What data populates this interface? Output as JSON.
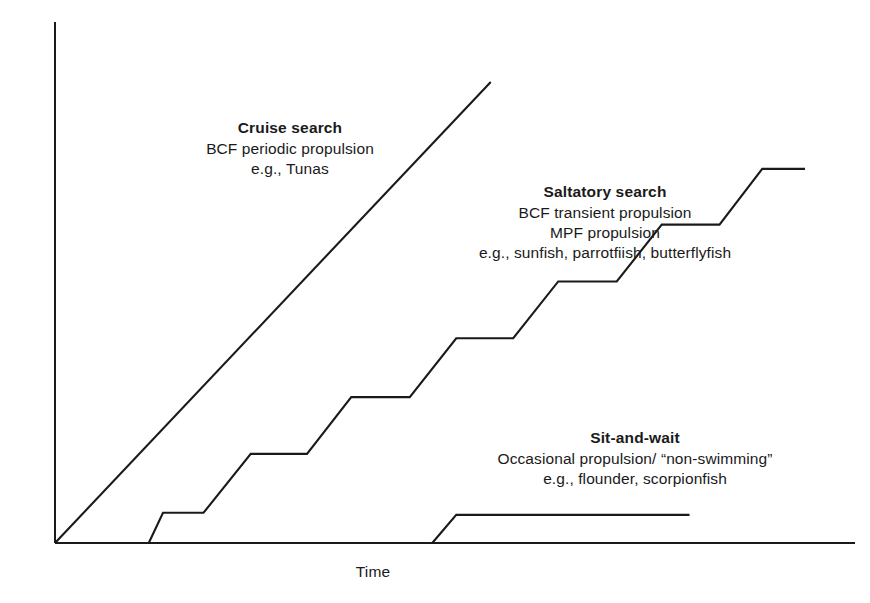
{
  "axes": {
    "x_title": "Time",
    "y_title": "Distance"
  },
  "annotations": {
    "cruise": {
      "title": "Cruise search",
      "line2": "BCF periodic propulsion",
      "line3": "e.g., Tunas"
    },
    "saltatory": {
      "title": "Saltatory search",
      "line2": "BCF transient propulsion",
      "line3": "MPF propulsion",
      "line4": "e.g., sunfish, parrotfiish, butterflyfish"
    },
    "sitwait": {
      "title": "Sit-and-wait",
      "line2": "Occasional propulsion/ “non-swimming”",
      "line3": "e.g., flounder, scorpionfish"
    }
  },
  "style": {
    "line_color": "#1a1a1a",
    "axis_color": "#1a1a1a",
    "background": "#ffffff"
  },
  "chart_data": {
    "type": "line",
    "title": "",
    "xlabel": "Time",
    "ylabel": "Distance",
    "grid": false,
    "legend": "none",
    "axis_ticks": {
      "x": [],
      "y": []
    },
    "xlim": [
      0,
      100
    ],
    "ylim": [
      0,
      100
    ],
    "series": [
      {
        "name": "Cruise search",
        "style": "straight-line",
        "points": [
          {
            "x": 0.0,
            "y": 0.0
          },
          {
            "x": 58.1,
            "y": 88.5
          }
        ]
      },
      {
        "name": "Saltatory search",
        "style": "staircase",
        "points": [
          {
            "x": 12.5,
            "y": 0.0
          },
          {
            "x": 14.4,
            "y": 5.8
          },
          {
            "x": 19.8,
            "y": 5.8
          },
          {
            "x": 26.1,
            "y": 17.1
          },
          {
            "x": 33.6,
            "y": 17.1
          },
          {
            "x": 39.5,
            "y": 28.0
          },
          {
            "x": 47.3,
            "y": 28.0
          },
          {
            "x": 53.5,
            "y": 39.3
          },
          {
            "x": 61.1,
            "y": 39.3
          },
          {
            "x": 67.1,
            "y": 50.2
          },
          {
            "x": 74.9,
            "y": 50.2
          },
          {
            "x": 80.9,
            "y": 61.1
          },
          {
            "x": 88.6,
            "y": 61.1
          },
          {
            "x": 94.3,
            "y": 71.8
          },
          {
            "x": 100.0,
            "y": 71.8
          }
        ]
      },
      {
        "name": "Sit-and-wait",
        "style": "step-then-flat",
        "points": [
          {
            "x": 50.3,
            "y": 0.0
          },
          {
            "x": 53.5,
            "y": 5.4
          },
          {
            "x": 84.6,
            "y": 5.4
          }
        ]
      }
    ]
  }
}
